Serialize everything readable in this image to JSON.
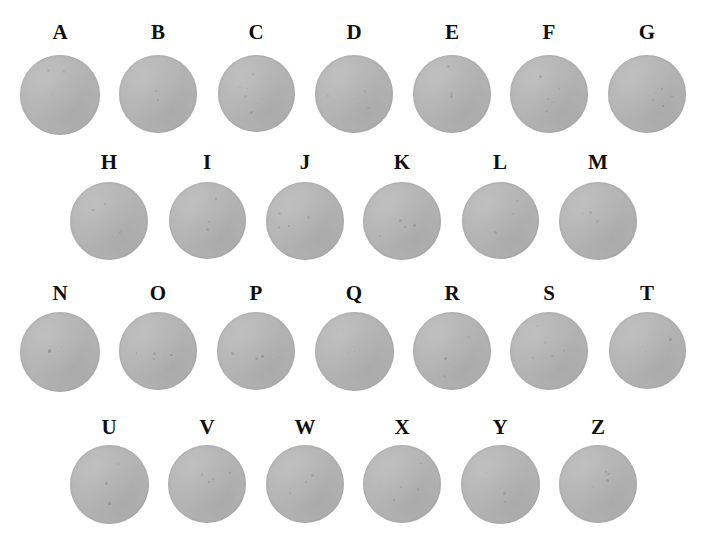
{
  "figure": {
    "width": 701,
    "height": 555,
    "background_color": "#ffffff",
    "disc_color": "#b4b4b4",
    "label_color": "#100f10",
    "rows": [
      {
        "row_index": 1,
        "label_y": 22,
        "disc_y": 55,
        "disc_size": 78,
        "first_center_x": 60,
        "spacing": 97.6,
        "items": [
          {
            "label": "A",
            "center_x": 60,
            "disc_diameter": 80
          },
          {
            "label": "B",
            "center_x": 158,
            "disc_diameter": 78
          },
          {
            "label": "C",
            "center_x": 256,
            "disc_diameter": 77
          },
          {
            "label": "D",
            "center_x": 354,
            "disc_diameter": 78
          },
          {
            "label": "E",
            "center_x": 452,
            "disc_diameter": 78
          },
          {
            "label": "F",
            "center_x": 549,
            "disc_diameter": 78
          },
          {
            "label": "G",
            "center_x": 647,
            "disc_diameter": 78
          }
        ]
      },
      {
        "row_index": 2,
        "label_y": 152,
        "disc_y": 182,
        "disc_size": 77,
        "first_center_x": 109,
        "spacing": 97.6,
        "items": [
          {
            "label": "H",
            "center_x": 109,
            "disc_diameter": 78
          },
          {
            "label": "I",
            "center_x": 207,
            "disc_diameter": 77
          },
          {
            "label": "J",
            "center_x": 305,
            "disc_diameter": 78
          },
          {
            "label": "K",
            "center_x": 402,
            "disc_diameter": 78
          },
          {
            "label": "L",
            "center_x": 500,
            "disc_diameter": 77
          },
          {
            "label": "M",
            "center_x": 598,
            "disc_diameter": 78
          }
        ]
      },
      {
        "row_index": 3,
        "label_y": 283,
        "disc_y": 312,
        "disc_size": 78,
        "first_center_x": 60,
        "spacing": 97.6,
        "items": [
          {
            "label": "N",
            "center_x": 60,
            "disc_diameter": 80
          },
          {
            "label": "O",
            "center_x": 158,
            "disc_diameter": 78
          },
          {
            "label": "P",
            "center_x": 256,
            "disc_diameter": 78
          },
          {
            "label": "Q",
            "center_x": 354,
            "disc_diameter": 79
          },
          {
            "label": "R",
            "center_x": 452,
            "disc_diameter": 78
          },
          {
            "label": "S",
            "center_x": 549,
            "disc_diameter": 78
          },
          {
            "label": "T",
            "center_x": 647,
            "disc_diameter": 77
          }
        ]
      },
      {
        "row_index": 4,
        "label_y": 417,
        "disc_y": 445,
        "disc_size": 78,
        "first_center_x": 109,
        "spacing": 97.6,
        "items": [
          {
            "label": "U",
            "center_x": 109,
            "disc_diameter": 79
          },
          {
            "label": "V",
            "center_x": 207,
            "disc_diameter": 78
          },
          {
            "label": "W",
            "center_x": 305,
            "disc_diameter": 78
          },
          {
            "label": "X",
            "center_x": 402,
            "disc_diameter": 78
          },
          {
            "label": "Y",
            "center_x": 500,
            "disc_diameter": 79
          },
          {
            "label": "Z",
            "center_x": 598,
            "disc_diameter": 78
          }
        ]
      }
    ]
  }
}
